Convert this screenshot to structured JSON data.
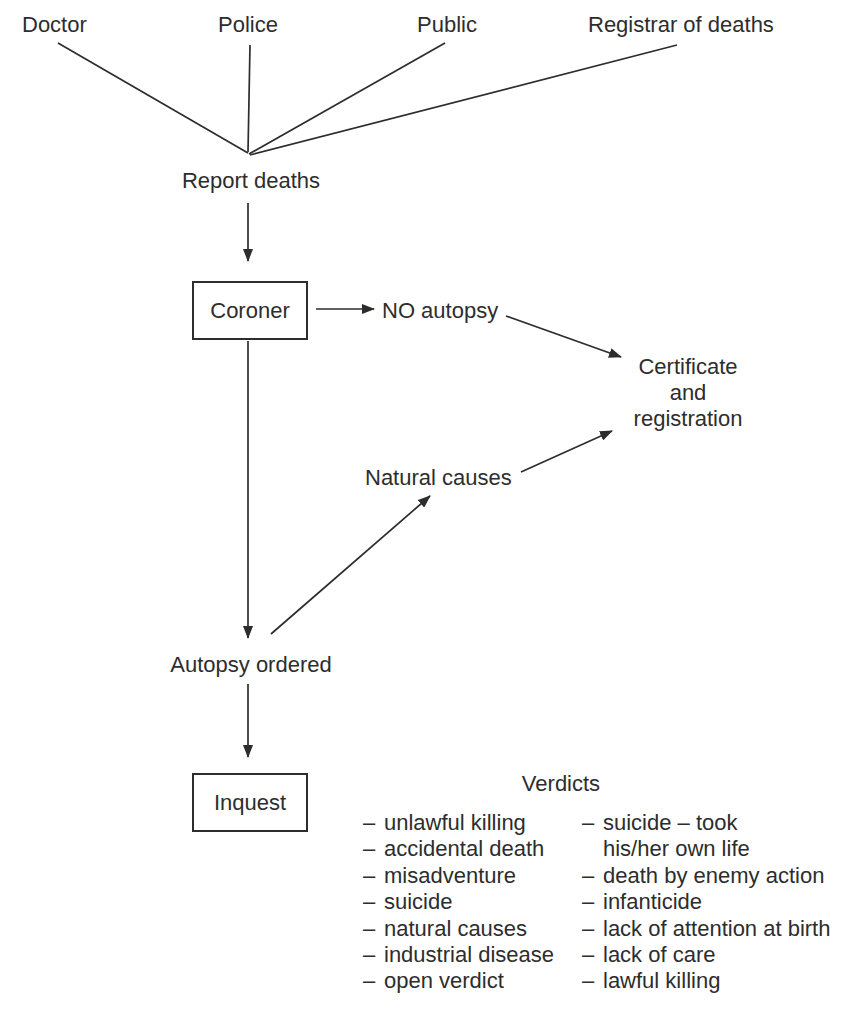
{
  "sources": {
    "doctor": "Doctor",
    "police": "Police",
    "public": "Public",
    "registrar": "Registrar of deaths"
  },
  "flow": {
    "report_deaths": "Report deaths",
    "coroner": "Coroner",
    "no_autopsy": "NO autopsy",
    "certificate": {
      "line1": "Certificate",
      "line2": "and",
      "line3": "registration"
    },
    "natural_causes": "Natural causes",
    "autopsy_ordered": "Autopsy ordered",
    "inquest": "Inquest"
  },
  "verdicts": {
    "title": "Verdicts",
    "left": [
      {
        "dash": "–",
        "text": "unlawful killing"
      },
      {
        "dash": "–",
        "text": "accidental death"
      },
      {
        "dash": "–",
        "text": "misadventure"
      },
      {
        "dash": "–",
        "text": "suicide"
      },
      {
        "dash": "–",
        "text": "natural causes"
      },
      {
        "dash": "–",
        "text": "industrial disease"
      },
      {
        "dash": "–",
        "text": "open verdict"
      }
    ],
    "right": [
      {
        "dash": "–",
        "text": "suicide – took"
      },
      {
        "dash": "",
        "text": "his/her own life"
      },
      {
        "dash": "–",
        "text": "death by enemy action"
      },
      {
        "dash": "–",
        "text": "infanticide"
      },
      {
        "dash": "–",
        "text": "lack of attention at birth"
      },
      {
        "dash": "–",
        "text": "lack of care"
      },
      {
        "dash": "–",
        "text": "lawful killing"
      }
    ]
  },
  "colors": {
    "ink": "#2d2d2d",
    "background": "#ffffff"
  }
}
